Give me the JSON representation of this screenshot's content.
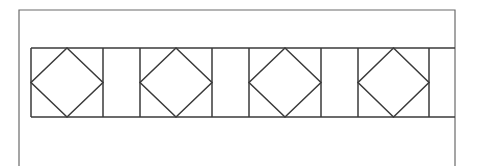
{
  "diagram": {
    "type": "decorative-border-pattern",
    "stroke_color": "#3a3a3a",
    "frame_color": "#6a6a6a",
    "background": "#ffffff",
    "frame": {
      "left": 19,
      "top": 10,
      "right": 455,
      "bottom": 166
    },
    "band": {
      "left": 31,
      "top": 48,
      "right": 455,
      "bottom": 117
    },
    "cells": [
      {
        "kind": "diamond-square",
        "x0": 31,
        "x1": 103
      },
      {
        "kind": "plain-panel",
        "x0": 103,
        "x1": 140
      },
      {
        "kind": "diamond-square",
        "x0": 140,
        "x1": 212
      },
      {
        "kind": "plain-panel",
        "x0": 212,
        "x1": 249
      },
      {
        "kind": "diamond-square",
        "x0": 249,
        "x1": 321
      },
      {
        "kind": "plain-panel",
        "x0": 321,
        "x1": 358
      },
      {
        "kind": "diamond-square",
        "x0": 358,
        "x1": 429
      },
      {
        "kind": "plain-panel",
        "x0": 429,
        "x1": 455
      }
    ]
  }
}
